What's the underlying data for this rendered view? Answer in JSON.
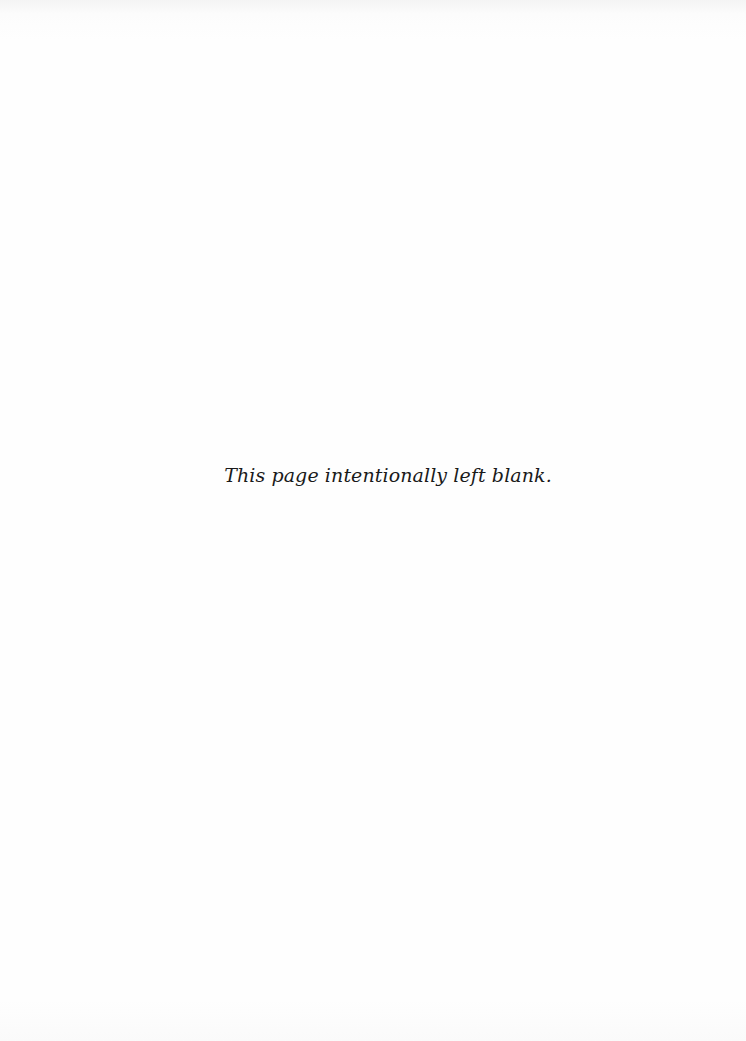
{
  "page": {
    "background_color": "#fdfdfd",
    "text_color": "#1a1a1a",
    "note": "This page intentionally left blank."
  }
}
